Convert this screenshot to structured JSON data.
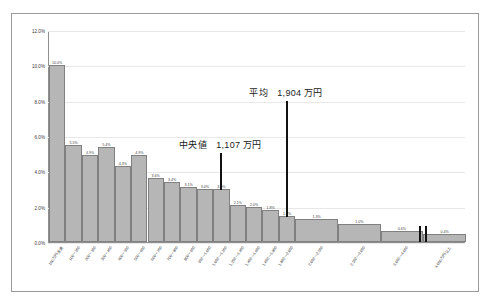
{
  "chart_data": {
    "type": "bar",
    "title": "",
    "xlabel": "",
    "ylabel": "",
    "ylim": [
      0,
      12
    ],
    "grid": true,
    "legend": "none",
    "ytick_labels": [
      "0.0%",
      "2.0%",
      "4.0%",
      "6.0%",
      "8.0%",
      "10.0%",
      "12.0%"
    ],
    "ytick_values": [
      0,
      2,
      4,
      6,
      8,
      10,
      12
    ],
    "categories": [
      "100万円未満",
      "100～200",
      "200～300",
      "300～400",
      "400～500",
      "500～600",
      "600～700",
      "700～800",
      "800～900",
      "900～1,000",
      "1,000～1,200",
      "1,200～1,400",
      "1,400～1,600",
      "1,600～1,800",
      "1,800～2,000",
      "2,000～2,500",
      "2,500～3,000",
      "3,000～4,000",
      "4,000万円以上"
    ],
    "values": [
      10.0,
      5.5,
      4.9,
      5.4,
      4.3,
      4.9,
      3.6,
      3.4,
      3.1,
      3.0,
      3.0,
      2.1,
      2.0,
      1.8,
      1.5,
      1.3,
      1.0,
      0.6,
      0.45
    ],
    "data_labels": [
      "10.0%",
      "5.5%",
      "4.9%",
      "5.4%",
      "4.3%",
      "4.9%",
      "3.6%",
      "3.4%",
      "3.1%",
      "3.0%",
      "3.0%",
      "2.1%",
      "2.0%",
      "1.8%",
      "1.5%",
      "1.3%",
      "1.0%",
      "0.6%",
      "0.4%"
    ],
    "wide_bar_indices": [
      15,
      16,
      17,
      18
    ],
    "annotations": [
      {
        "name": "median",
        "label_prefix": "中央値",
        "value_text": "1,107 万円",
        "full_text": "中央値　1,107 万円",
        "x_category_index": 10
      },
      {
        "name": "mean",
        "label_prefix": "平均",
        "value_text": "1,904 万円",
        "full_text": "平均　1,904 万円",
        "x_category_index": 14
      }
    ],
    "axis_break": {
      "present": true,
      "after_category_index": 17
    }
  }
}
